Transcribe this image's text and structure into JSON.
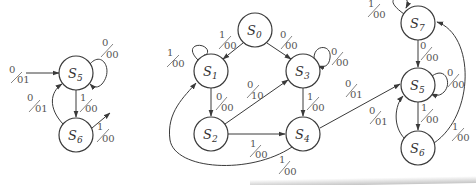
{
  "figure": {
    "subdiagrams": [
      {
        "id": "left",
        "states": [
          {
            "name": "S",
            "sub": "5",
            "x": 76,
            "y": 73
          },
          {
            "name": "S",
            "sub": "6",
            "x": 76,
            "y": 135
          }
        ],
        "transitions": [
          {
            "from": "in",
            "to": "S5",
            "input": "0",
            "output": "01"
          },
          {
            "from": "S5",
            "to": "S5",
            "input": "0",
            "output": "00"
          },
          {
            "from": "S5",
            "to": "S6",
            "input": "1",
            "output": "00"
          },
          {
            "from": "S6",
            "to": "S5",
            "input": "0",
            "output": "01"
          },
          {
            "from": "S6",
            "to": "out",
            "input": "1",
            "output": "00"
          }
        ]
      },
      {
        "id": "middle",
        "states": [
          {
            "name": "S",
            "sub": "0",
            "x": 255,
            "y": 30
          },
          {
            "name": "S",
            "sub": "1",
            "x": 211,
            "y": 71
          },
          {
            "name": "S",
            "sub": "2",
            "x": 211,
            "y": 134
          },
          {
            "name": "S",
            "sub": "3",
            "x": 303,
            "y": 71
          },
          {
            "name": "S",
            "sub": "4",
            "x": 303,
            "y": 134
          }
        ],
        "transitions": [
          {
            "from": "S0",
            "to": "S1",
            "input": "1",
            "output": "00"
          },
          {
            "from": "S0",
            "to": "S3",
            "input": "0",
            "output": "00"
          },
          {
            "from": "S1",
            "to": "S1",
            "input": "1",
            "output": "00"
          },
          {
            "from": "S1",
            "to": "S2",
            "input": "0",
            "output": "00"
          },
          {
            "from": "S2",
            "to": "S3",
            "input": "0",
            "output": "10"
          },
          {
            "from": "S2",
            "to": "S4",
            "input": "1",
            "output": "00"
          },
          {
            "from": "S3",
            "to": "S3",
            "input": "0",
            "output": "00"
          },
          {
            "from": "S3",
            "to": "S4",
            "input": "1",
            "output": "00"
          },
          {
            "from": "S4",
            "to": "S1",
            "input": "1",
            "output": "00"
          },
          {
            "from": "S4",
            "to": "S5",
            "input": "0",
            "output": "01"
          }
        ]
      },
      {
        "id": "right",
        "states": [
          {
            "name": "S",
            "sub": "7",
            "x": 418,
            "y": 23
          },
          {
            "name": "S",
            "sub": "5",
            "x": 418,
            "y": 85
          },
          {
            "name": "S",
            "sub": "6",
            "x": 418,
            "y": 148
          }
        ],
        "transitions": [
          {
            "from": "S7",
            "to": "S7",
            "input": "1",
            "output": "00"
          },
          {
            "from": "S7",
            "to": "S5",
            "input": "0",
            "output": "00"
          },
          {
            "from": "S5",
            "to": "S5",
            "input": "0",
            "output": "00"
          },
          {
            "from": "S5",
            "to": "S6",
            "input": "1",
            "output": "00"
          },
          {
            "from": "S6",
            "to": "S5",
            "input": "0",
            "output": "01"
          },
          {
            "from": "S6",
            "to": "S7",
            "input": "1",
            "output": "00"
          }
        ]
      }
    ],
    "labels": {
      "l_in": {
        "in": "0",
        "out": "01"
      },
      "l_s5loop": {
        "in": "0",
        "out": "00"
      },
      "l_s5s6": {
        "in": "1",
        "out": "00"
      },
      "l_s6s5": {
        "in": "0",
        "out": "01"
      },
      "l_s6out": {
        "in": "1",
        "out": "00"
      },
      "m_s0s1": {
        "in": "1",
        "out": "00"
      },
      "m_s0s3": {
        "in": "0",
        "out": "00"
      },
      "m_s1loop": {
        "in": "1",
        "out": "00"
      },
      "m_s1s2": {
        "in": "0",
        "out": "00"
      },
      "m_s2s3": {
        "in": "0",
        "out": "10"
      },
      "m_s2s4": {
        "in": "1",
        "out": "00"
      },
      "m_s3loop": {
        "in": "0",
        "out": "00"
      },
      "m_s3s4": {
        "in": "1",
        "out": "00"
      },
      "m_s4s1": {
        "in": "1",
        "out": "00"
      },
      "m_s4s5": {
        "in": "0",
        "out": "01"
      },
      "r_s7loop": {
        "in": "1",
        "out": "00"
      },
      "r_s7s5": {
        "in": "0",
        "out": "00"
      },
      "r_s5loop": {
        "in": "0",
        "out": "00"
      },
      "r_s5s6": {
        "in": "1",
        "out": "00"
      },
      "r_s6s5": {
        "in": "0",
        "out": "01"
      },
      "r_s6s7": {
        "in": "1",
        "out": "00"
      }
    },
    "state_labels": {
      "S": "S",
      "l5": "5",
      "l6": "6",
      "m0": "0",
      "m1": "1",
      "m2": "2",
      "m3": "3",
      "m4": "4",
      "r7": "7",
      "r5": "5",
      "r6": "6"
    },
    "colors": {
      "stroke": "#3a3a3a",
      "label": "#555555",
      "background": "#ffffff"
    }
  }
}
